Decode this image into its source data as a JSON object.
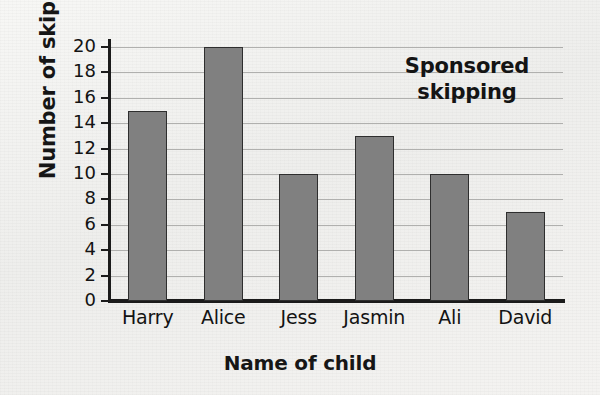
{
  "chart_data": {
    "type": "bar",
    "title_lines": [
      "Sponsored",
      "skipping"
    ],
    "xlabel": "Name of child",
    "ylabel": "Number of skips",
    "categories": [
      "Harry",
      "Alice",
      "Jess",
      "Jasmin",
      "Ali",
      "David"
    ],
    "values": [
      15,
      20,
      10,
      13,
      10,
      7
    ],
    "ylim": [
      0,
      20
    ],
    "ytick_step": 2,
    "yticks": [
      0,
      2,
      4,
      6,
      8,
      10,
      12,
      14,
      16,
      18,
      20
    ],
    "ytick_labels": [
      "0",
      "2",
      "4",
      "6",
      "8",
      "10",
      "12",
      "14",
      "16",
      "18",
      "20"
    ],
    "grid": true,
    "grid_axis": "y",
    "legend": false,
    "bar_color": "#808080",
    "bar_edge_color": "#2e2e2e",
    "axis_color": "#1b1b1b",
    "grid_color": "#b0b0ae",
    "background_color": "#f2f2f0",
    "text_color": "#131313"
  }
}
